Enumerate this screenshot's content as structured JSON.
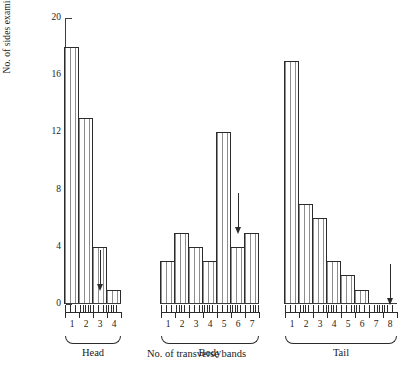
{
  "chart_data": {
    "type": "bar",
    "title": "",
    "xlabel": "No. of transverse bands",
    "ylabel": "No. of sides examined",
    "ylim": [
      0,
      20
    ],
    "yticks": [
      0,
      4,
      8,
      12,
      16,
      20
    ],
    "grid": false,
    "legend": null,
    "groups": [
      {
        "name": "Head",
        "categories": [
          "1",
          "2",
          "3",
          "4"
        ],
        "values": [
          18,
          13,
          4,
          1
        ],
        "annotation": {
          "type": "arrow",
          "after_category": "3",
          "points": "down"
        }
      },
      {
        "name": "Body",
        "categories": [
          "1",
          "2",
          "3",
          "4",
          "5",
          "6",
          "7"
        ],
        "values": [
          3,
          5,
          4,
          3,
          12,
          4,
          5
        ],
        "annotation": {
          "type": "arrow",
          "after_category": "6",
          "points": "down"
        }
      },
      {
        "name": "Tail",
        "categories": [
          "1",
          "2",
          "3",
          "4",
          "5",
          "6",
          "7",
          "8"
        ],
        "values": [
          17,
          7,
          6,
          3,
          2,
          1,
          0,
          0
        ],
        "annotation": {
          "type": "arrow",
          "after_category": "8",
          "points": "down"
        }
      }
    ],
    "colors": {
      "bar_fill": "#fdfdfd",
      "bar_hatch": "#8d8d8d",
      "bar_edge": "#2b2b2b",
      "axis": "#3d3d3d",
      "text": "#1a1a1a"
    }
  }
}
